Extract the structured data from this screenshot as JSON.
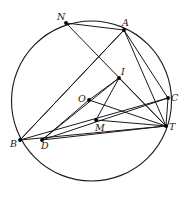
{
  "figure": {
    "type": "circle-geometry-diagram",
    "caption": "",
    "stroke_color": "#1a1a1a",
    "point_color": "#000000",
    "background": "#ffffff",
    "circle": {
      "cx": 91.5,
      "cy": 101,
      "r": 80
    },
    "points": [
      {
        "id": "N",
        "label": "N",
        "x": 66,
        "y": 23,
        "label_dx": -9,
        "label_dy": -11,
        "on_circle": true
      },
      {
        "id": "A",
        "label": "A",
        "x": 124,
        "y": 30,
        "label_dx": -2,
        "label_dy": -12,
        "on_circle": true
      },
      {
        "id": "C",
        "label": "C",
        "x": 168,
        "y": 98,
        "label_dx": 3,
        "label_dy": -5,
        "on_circle": true
      },
      {
        "id": "T",
        "label": "T",
        "x": 166,
        "y": 126,
        "label_dx": 3,
        "label_dy": -4,
        "on_circle": true
      },
      {
        "id": "B",
        "label": "B",
        "x": 20,
        "y": 140,
        "label_dx": -10,
        "label_dy": -1,
        "on_circle": true
      },
      {
        "id": "D",
        "label": "D",
        "x": 42,
        "y": 140,
        "label_dx": -1,
        "label_dy": 1,
        "on_circle": true
      },
      {
        "id": "I",
        "label": "I",
        "x": 119,
        "y": 78,
        "label_dx": 2,
        "label_dy": -11,
        "on_circle": false
      },
      {
        "id": "O",
        "label": "O",
        "x": 89,
        "y": 100,
        "label_dx": -11,
        "label_dy": -6,
        "on_circle": false
      },
      {
        "id": "M",
        "label": "M",
        "x": 96,
        "y": 120,
        "label_dx": -1,
        "label_dy": 3,
        "on_circle": false
      }
    ],
    "segments": [
      {
        "from": "N",
        "to": "A"
      },
      {
        "from": "N",
        "to": "T"
      },
      {
        "from": "A",
        "to": "B"
      },
      {
        "from": "A",
        "to": "C"
      },
      {
        "from": "A",
        "to": "T"
      },
      {
        "from": "B",
        "to": "A"
      },
      {
        "from": "B",
        "to": "C"
      },
      {
        "from": "B",
        "to": "T"
      },
      {
        "from": "D",
        "to": "I"
      },
      {
        "from": "D",
        "to": "C"
      },
      {
        "from": "D",
        "to": "T"
      },
      {
        "from": "D",
        "to": "O"
      },
      {
        "from": "I",
        "to": "M"
      },
      {
        "from": "I",
        "to": "T"
      },
      {
        "from": "O",
        "to": "I"
      },
      {
        "from": "O",
        "to": "T"
      },
      {
        "from": "C",
        "to": "T"
      },
      {
        "from": "M",
        "to": "T"
      }
    ]
  }
}
